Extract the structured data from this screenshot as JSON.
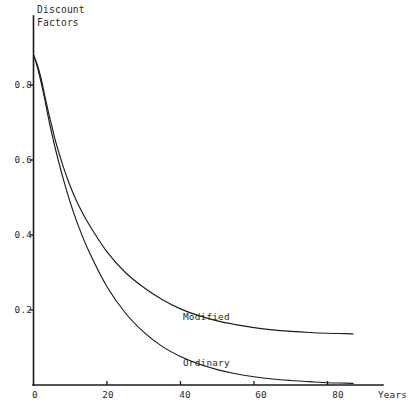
{
  "chart_data": {
    "type": "line",
    "title_lines": [
      "Discount",
      "Factors"
    ],
    "xlabel": "Years",
    "ylabel": "Discount Factors",
    "xlim": [
      0,
      92
    ],
    "ylim": [
      0,
      0.95
    ],
    "grid": false,
    "legend_position": "inline-annotations",
    "xticks": [
      0,
      20,
      40,
      60,
      80
    ],
    "xtick_labels": [
      "0",
      "20",
      "40",
      "60",
      "80"
    ],
    "yticks": [
      0.2,
      0.4,
      0.6,
      0.8
    ],
    "ytick_labels": [
      "0.2",
      "0.4",
      "0.6",
      "0.8"
    ],
    "series": [
      {
        "name": "Modified",
        "label": "Modified",
        "color": "#1c1c1c",
        "x": [
          0,
          1,
          2,
          3,
          4,
          5,
          6,
          8,
          10,
          12,
          15,
          20,
          25,
          30,
          35,
          40,
          45,
          50,
          55,
          60,
          65,
          70,
          75,
          80,
          85,
          87
        ],
        "values": [
          0.88,
          0.855,
          0.82,
          0.775,
          0.73,
          0.69,
          0.65,
          0.585,
          0.53,
          0.485,
          0.43,
          0.355,
          0.3,
          0.26,
          0.228,
          0.203,
          0.185,
          0.171,
          0.161,
          0.153,
          0.147,
          0.143,
          0.14,
          0.138,
          0.137,
          0.136
        ]
      },
      {
        "name": "Ordinary",
        "label": "Ordinary",
        "color": "#1c1c1c",
        "x": [
          0,
          1,
          2,
          3,
          4,
          5,
          6,
          8,
          10,
          12,
          15,
          20,
          25,
          30,
          35,
          40,
          45,
          50,
          55,
          60,
          65,
          70,
          75,
          80,
          85,
          87
        ],
        "values": [
          0.88,
          0.85,
          0.81,
          0.765,
          0.715,
          0.67,
          0.628,
          0.553,
          0.487,
          0.43,
          0.358,
          0.262,
          0.192,
          0.141,
          0.103,
          0.076,
          0.056,
          0.041,
          0.03,
          0.022,
          0.016,
          0.012,
          0.009,
          0.006,
          0.005,
          0.004
        ]
      }
    ],
    "annotations": [
      {
        "text": "Modified",
        "x": 20,
        "y": 0.195
      },
      {
        "text": "Ordinary",
        "x": 20,
        "y": 0.075
      }
    ]
  }
}
